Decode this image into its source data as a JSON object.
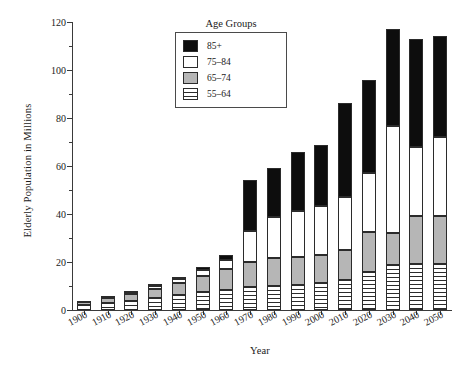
{
  "chart_data": {
    "type": "bar",
    "stacked": true,
    "title": "",
    "xlabel": "Year",
    "ylabel": "Elderly Population in Millions",
    "ylim": [
      0,
      120
    ],
    "ytick_major_step": 20,
    "ytick_minor_step": 10,
    "ytick_labels": [
      "0",
      "20",
      "40",
      "60",
      "80",
      "100",
      "120"
    ],
    "grid": false,
    "legend_title": "Age Groups",
    "legend_position": "top-center-right",
    "categories": [
      "1900",
      "1910",
      "1920",
      "1930",
      "1940",
      "1950",
      "1960",
      "1970",
      "1980",
      "1990",
      "2000",
      "2010",
      "2020",
      "2030",
      "2040",
      "2050"
    ],
    "series": [
      {
        "name": "55–64",
        "key": "55-64",
        "fill": "horizontal-stripes",
        "color": "#ffffff",
        "values": [
          2.2,
          3.0,
          3.8,
          5.0,
          6.2,
          7.3,
          8.5,
          9.6,
          10.0,
          10.5,
          11.4,
          12.4,
          16.0,
          18.8,
          19.0,
          19.3
        ]
      },
      {
        "name": "65–74",
        "key": "65-74",
        "fill": "solid",
        "color": "#b6b6b6",
        "values": [
          1.3,
          2.2,
          2.8,
          3.8,
          5.0,
          6.8,
          8.4,
          10.4,
          11.8,
          11.5,
          11.4,
          12.6,
          16.5,
          13.2,
          20.0,
          19.8
        ]
      },
      {
        "name": "75–84",
        "key": "75-84",
        "fill": "solid",
        "color": "#ffffff",
        "values": [
          0.3,
          0.6,
          0.9,
          1.4,
          1.9,
          2.6,
          4.0,
          13.0,
          17.1,
          19.2,
          20.6,
          22.0,
          24.5,
          44.5,
          29.0,
          33.0
        ]
      },
      {
        "name": "85+",
        "key": "85+",
        "fill": "solid",
        "color": "#0d0d0d",
        "values": [
          0.0,
          0.2,
          0.3,
          0.5,
          0.8,
          1.2,
          1.9,
          21.0,
          20.3,
          24.5,
          25.3,
          39.3,
          39.0,
          40.5,
          45.0,
          41.9
        ]
      }
    ],
    "totals": [
      3.8,
      6.0,
      7.8,
      10.7,
      13.9,
      17.9,
      22.8,
      54.0,
      59.2,
      65.7,
      68.7,
      86.3,
      96.0,
      117.0,
      113.0,
      114.0
    ],
    "legend_entries": [
      {
        "label": "85+",
        "swatch": "black-square"
      },
      {
        "label": "75–84",
        "swatch": "white-square"
      },
      {
        "label": "65–74",
        "swatch": "gray-square"
      },
      {
        "label": "55–64",
        "swatch": "striped-square"
      }
    ],
    "colors": {
      "85+": "#0d0d0d",
      "75-84": "#ffffff",
      "65-74": "#b6b6b6",
      "55-64": "#ffffff",
      "axis": "#3a3a3a",
      "outline": "#2b2b2b",
      "background": "#ffffff"
    }
  }
}
